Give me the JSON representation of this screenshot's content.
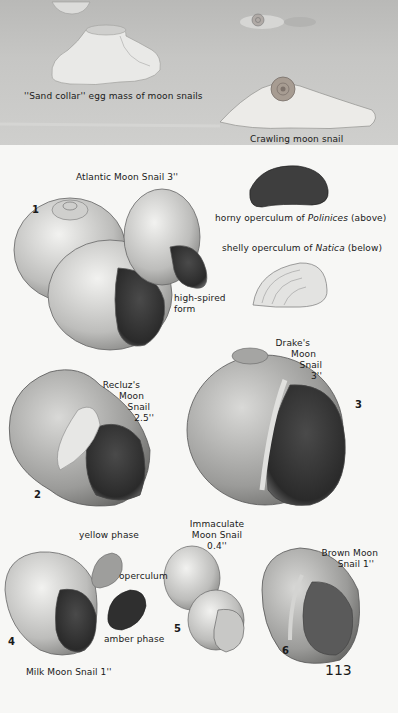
{
  "top_scene": {
    "egg_mass_caption": "''Sand collar'' egg mass of moon snails",
    "crawling_caption": "Crawling moon snail"
  },
  "plate": {
    "atlantic": {
      "number": "1",
      "title": "Atlantic Moon Snail 3''",
      "variant_label_1": "high-spired",
      "variant_label_2": "form"
    },
    "operculum_horny": {
      "prefix": "horny operculum of ",
      "genus": "Polinices",
      "suffix": " (above)"
    },
    "operculum_shelly": {
      "prefix": "shelly operculum of ",
      "genus": "Natica",
      "suffix": " (below)"
    },
    "recluz": {
      "number": "2",
      "line1": "Recluz's",
      "line2": "Moon",
      "line3": "Snail",
      "line4": "2.5''"
    },
    "drake": {
      "number": "3",
      "line1": "Drake's",
      "line2": "Moon",
      "line3": "Snail",
      "line4": "3''"
    },
    "milk": {
      "number": "4",
      "title": "Milk Moon Snail 1''",
      "yellow_phase": "yellow phase",
      "operculum": "operculum",
      "amber_phase": "amber phase"
    },
    "immaculate": {
      "number": "5",
      "line1": "Immaculate",
      "line2": "Moon Snail",
      "line3": "0.4''"
    },
    "brown": {
      "number": "6",
      "line1": "Brown Moon",
      "line2": "Snail 1''"
    },
    "page_number": "113"
  },
  "colors": {
    "paper": "#f7f7f5",
    "sand": "#c4c4c2",
    "ink": "#1a1a1a",
    "shell_dark": "#3a3a3a"
  }
}
